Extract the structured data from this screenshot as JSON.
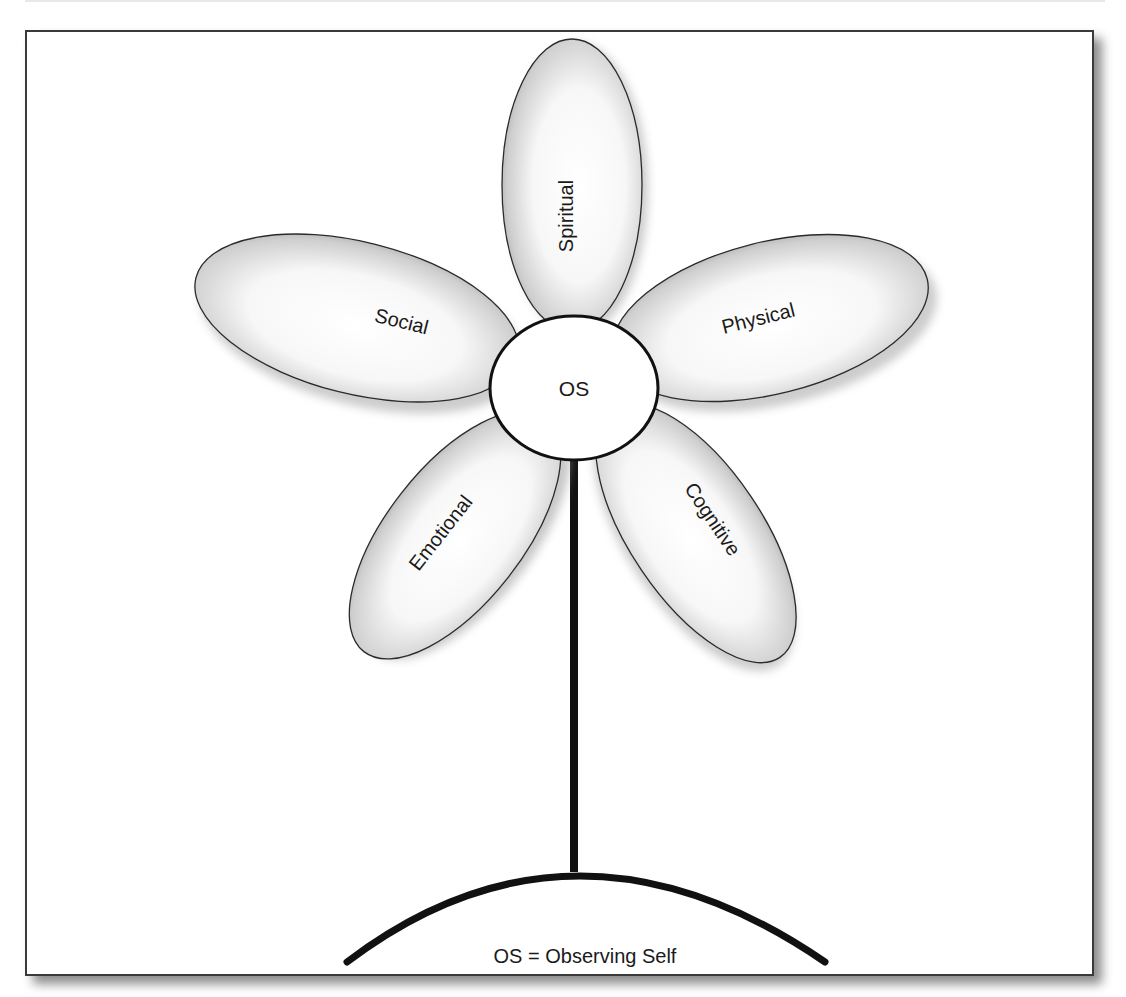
{
  "diagram": {
    "center": {
      "label": "OS"
    },
    "petals": [
      {
        "id": "spiritual",
        "label": "Spiritual"
      },
      {
        "id": "physical",
        "label": "Physical"
      },
      {
        "id": "cognitive",
        "label": "Cognitive"
      },
      {
        "id": "emotional",
        "label": "Emotional"
      },
      {
        "id": "social",
        "label": "Social"
      }
    ],
    "caption": "OS = Observing Self"
  },
  "colors": {
    "outline": "#2a2a2a",
    "petal_fill_light": "#ffffff",
    "petal_fill_dark": "#a8a8a8",
    "stem": "#111111"
  }
}
